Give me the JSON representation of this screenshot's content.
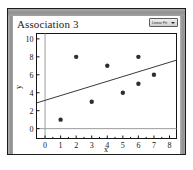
{
  "window": {
    "title_strip_color": "#9a9a9a",
    "border_color": "#1b1b1b"
  },
  "header": {
    "title": "Association 3",
    "fit_button_label": "Linear Fit",
    "fit_button_icon": "chevron-down-icon"
  },
  "chart_data": {
    "type": "scatter",
    "title": "Association 3",
    "xlabel": "x",
    "ylabel": "y",
    "xlim": [
      -0.55,
      8.45
    ],
    "ylim": [
      -1.1,
      10.6
    ],
    "xticks": [
      0,
      1,
      2,
      3,
      4,
      5,
      6,
      7,
      8
    ],
    "yticks": [
      0,
      2,
      4,
      6,
      8,
      10
    ],
    "grid": false,
    "legend": "none",
    "points": [
      {
        "x": 1,
        "y": 1
      },
      {
        "x": 2,
        "y": 8
      },
      {
        "x": 3,
        "y": 3
      },
      {
        "x": 4,
        "y": 7
      },
      {
        "x": 5,
        "y": 4
      },
      {
        "x": 6,
        "y": 5
      },
      {
        "x": 6,
        "y": 8
      },
      {
        "x": 7,
        "y": 6
      }
    ],
    "series": [
      {
        "name": "data",
        "x": [
          1,
          2,
          3,
          4,
          5,
          6,
          6,
          7
        ],
        "values": [
          1,
          8,
          3,
          7,
          4,
          5,
          8,
          6
        ]
      }
    ],
    "trend_line": {
      "name": "linear fit",
      "slope": 0.53,
      "intercept": 3.15,
      "x_start": -0.55,
      "y_start": 2.86,
      "x_end": 8.45,
      "y_end": 7.63,
      "color": "#3a3a3a"
    },
    "reference_lines": [
      {
        "name": "x-zero-line",
        "orientation": "vertical",
        "value": 0,
        "color": "#9d9d9d"
      },
      {
        "name": "y-zero-line",
        "orientation": "horizontal",
        "value": 0,
        "color": "#9d9d9d"
      }
    ]
  }
}
